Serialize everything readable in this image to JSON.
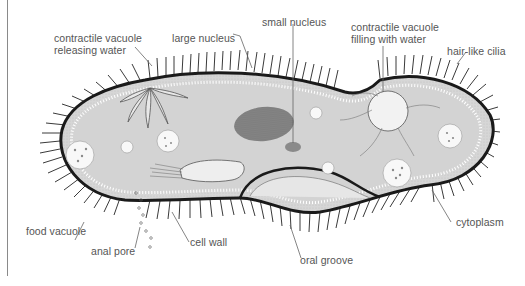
{
  "diagram": {
    "colors": {
      "cytoplasm": "#d3d3d3",
      "cell_wall": "#1a1a1a",
      "cilia": "#333333",
      "label_text": "#555555",
      "leader_line": "#666666",
      "frame_line": "#8a8a8a"
    },
    "labels": {
      "contractile_vacuole_releasing": {
        "line1": "contractile vacuole",
        "line2": "releasing water"
      },
      "large_nucleus": "large nucleus",
      "small_nucleus": "small nucleus",
      "contractile_vacuole_filling": {
        "line1": "contractile vacuole",
        "line2": "filling with water"
      },
      "hair_like_cilia": "hair-like cilia",
      "food_vacuole": "food vacuole",
      "anal_pore": "anal pore",
      "cell_wall": "cell wall",
      "oral_groove": "oral groove",
      "cytoplasm": "cytoplasm"
    }
  }
}
